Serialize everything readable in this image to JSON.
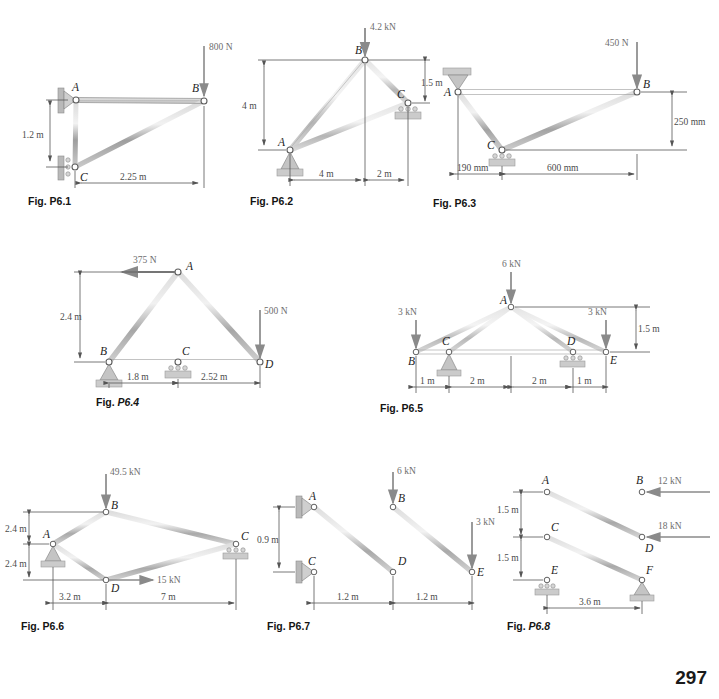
{
  "page": {
    "number": "297"
  },
  "figures": [
    {
      "id": "p6-1",
      "caption_prefix": "Fig. ",
      "caption_number": "P6.1",
      "caption_italic": false,
      "nodes": [
        {
          "label": "A"
        },
        {
          "label": "B"
        },
        {
          "label": "C"
        }
      ],
      "loads": [
        {
          "value": "800 N",
          "direction": "down",
          "at": "B"
        }
      ],
      "dimensions": [
        {
          "value": "1.2 m",
          "orientation": "vertical"
        },
        {
          "value": "2.25 m",
          "orientation": "horizontal"
        }
      ],
      "supports": [
        {
          "type": "pin",
          "at": "A",
          "mount": "wall"
        },
        {
          "type": "roller",
          "at": "C",
          "mount": "wall"
        }
      ]
    },
    {
      "id": "p6-2",
      "caption_prefix": "Fig. ",
      "caption_number": "P6.2",
      "caption_italic": false,
      "nodes": [
        {
          "label": "A"
        },
        {
          "label": "B"
        },
        {
          "label": "C"
        }
      ],
      "loads": [
        {
          "value": "4.2 kN",
          "direction": "down",
          "at": "B"
        }
      ],
      "dimensions": [
        {
          "value": "4 m",
          "orientation": "vertical"
        },
        {
          "value": "1.5 m",
          "orientation": "vertical"
        },
        {
          "value": "4 m",
          "orientation": "horizontal"
        },
        {
          "value": "2 m",
          "orientation": "horizontal"
        }
      ],
      "supports": [
        {
          "type": "pin",
          "at": "A",
          "mount": "ground"
        },
        {
          "type": "roller",
          "at": "C",
          "mount": "ground"
        }
      ]
    },
    {
      "id": "p6-3",
      "caption_prefix": "Fig. ",
      "caption_number": "P6.3",
      "caption_italic": false,
      "nodes": [
        {
          "label": "A"
        },
        {
          "label": "B"
        },
        {
          "label": "C"
        }
      ],
      "loads": [
        {
          "value": "450 N",
          "direction": "down",
          "at": "B"
        }
      ],
      "dimensions": [
        {
          "value": "250 mm",
          "orientation": "vertical"
        },
        {
          "value": "190 mm",
          "orientation": "horizontal"
        },
        {
          "value": "600 mm",
          "orientation": "horizontal"
        }
      ],
      "supports": [
        {
          "type": "pin",
          "at": "A",
          "mount": "ceiling"
        },
        {
          "type": "roller",
          "at": "C",
          "mount": "ground"
        }
      ]
    },
    {
      "id": "p6-4",
      "caption_prefix": "Fig. ",
      "caption_number": "P6.4",
      "caption_italic": true,
      "nodes": [
        {
          "label": "A"
        },
        {
          "label": "B"
        },
        {
          "label": "C"
        },
        {
          "label": "D"
        }
      ],
      "loads": [
        {
          "value": "375 N",
          "direction": "left",
          "at": "A"
        },
        {
          "value": "500 N",
          "direction": "down",
          "at": "D"
        }
      ],
      "dimensions": [
        {
          "value": "2.4 m",
          "orientation": "vertical"
        },
        {
          "value": "1.8 m",
          "orientation": "horizontal"
        },
        {
          "value": "2.52 m",
          "orientation": "horizontal"
        }
      ],
      "supports": [
        {
          "type": "pin",
          "at": "B",
          "mount": "ground"
        },
        {
          "type": "roller",
          "at": "C",
          "mount": "ground"
        }
      ]
    },
    {
      "id": "p6-5",
      "caption_prefix": "Fig. ",
      "caption_number": "P6.5",
      "caption_italic": false,
      "nodes": [
        {
          "label": "A"
        },
        {
          "label": "B"
        },
        {
          "label": "C"
        },
        {
          "label": "D"
        },
        {
          "label": "E"
        }
      ],
      "loads": [
        {
          "value": "6 kN",
          "direction": "down",
          "at": "A"
        },
        {
          "value": "3 kN",
          "direction": "down",
          "at": "B"
        },
        {
          "value": "3 kN",
          "direction": "down",
          "at": "E"
        }
      ],
      "dimensions": [
        {
          "value": "1.5 m",
          "orientation": "vertical"
        },
        {
          "value": "1 m",
          "orientation": "horizontal"
        },
        {
          "value": "2 m",
          "orientation": "horizontal"
        },
        {
          "value": "2 m",
          "orientation": "horizontal"
        },
        {
          "value": "1 m",
          "orientation": "horizontal"
        }
      ],
      "supports": [
        {
          "type": "pin",
          "at": "C",
          "mount": "ground"
        },
        {
          "type": "roller",
          "at": "D",
          "mount": "ground"
        }
      ]
    },
    {
      "id": "p6-6",
      "caption_prefix": "Fig. ",
      "caption_number": "P6.6",
      "caption_italic": false,
      "nodes": [
        {
          "label": "A"
        },
        {
          "label": "B"
        },
        {
          "label": "C"
        },
        {
          "label": "D"
        }
      ],
      "loads": [
        {
          "value": "49.5 kN",
          "direction": "down",
          "at": "B"
        },
        {
          "value": "15 kN",
          "direction": "right",
          "at": "D"
        }
      ],
      "dimensions": [
        {
          "value": "2.4 m",
          "orientation": "vertical"
        },
        {
          "value": "2.4 m",
          "orientation": "vertical"
        },
        {
          "value": "3.2 m",
          "orientation": "horizontal"
        },
        {
          "value": "7 m",
          "orientation": "horizontal"
        }
      ],
      "supports": [
        {
          "type": "pin",
          "at": "A",
          "mount": "ground"
        },
        {
          "type": "roller",
          "at": "C",
          "mount": "ground"
        }
      ]
    },
    {
      "id": "p6-7",
      "caption_prefix": "Fig. ",
      "caption_number": "P6.7",
      "caption_italic": false,
      "nodes": [
        {
          "label": "A"
        },
        {
          "label": "B"
        },
        {
          "label": "C"
        },
        {
          "label": "D"
        },
        {
          "label": "E"
        }
      ],
      "loads": [
        {
          "value": "6 kN",
          "direction": "down",
          "at": "B"
        },
        {
          "value": "3 kN",
          "direction": "down",
          "at": "E"
        }
      ],
      "dimensions": [
        {
          "value": "0.9 m",
          "orientation": "vertical"
        },
        {
          "value": "1.2 m",
          "orientation": "horizontal"
        },
        {
          "value": "1.2 m",
          "orientation": "horizontal"
        }
      ],
      "supports": [
        {
          "type": "pin",
          "at": "A",
          "mount": "wall"
        },
        {
          "type": "pin",
          "at": "C",
          "mount": "wall"
        }
      ]
    },
    {
      "id": "p6-8",
      "caption_prefix": "Fig. ",
      "caption_number": "P6.8",
      "caption_italic": true,
      "nodes": [
        {
          "label": "A"
        },
        {
          "label": "B"
        },
        {
          "label": "C"
        },
        {
          "label": "D"
        },
        {
          "label": "E"
        },
        {
          "label": "F"
        }
      ],
      "loads": [
        {
          "value": "12 kN",
          "direction": "left",
          "at": "B"
        },
        {
          "value": "18 kN",
          "direction": "left",
          "at": "D"
        }
      ],
      "dimensions": [
        {
          "value": "1.5 m",
          "orientation": "vertical"
        },
        {
          "value": "1.5 m",
          "orientation": "vertical"
        },
        {
          "value": "3.6 m",
          "orientation": "horizontal"
        }
      ],
      "supports": [
        {
          "type": "roller",
          "at": "E",
          "mount": "ground"
        },
        {
          "type": "pin",
          "at": "F",
          "mount": "ground"
        }
      ]
    }
  ]
}
